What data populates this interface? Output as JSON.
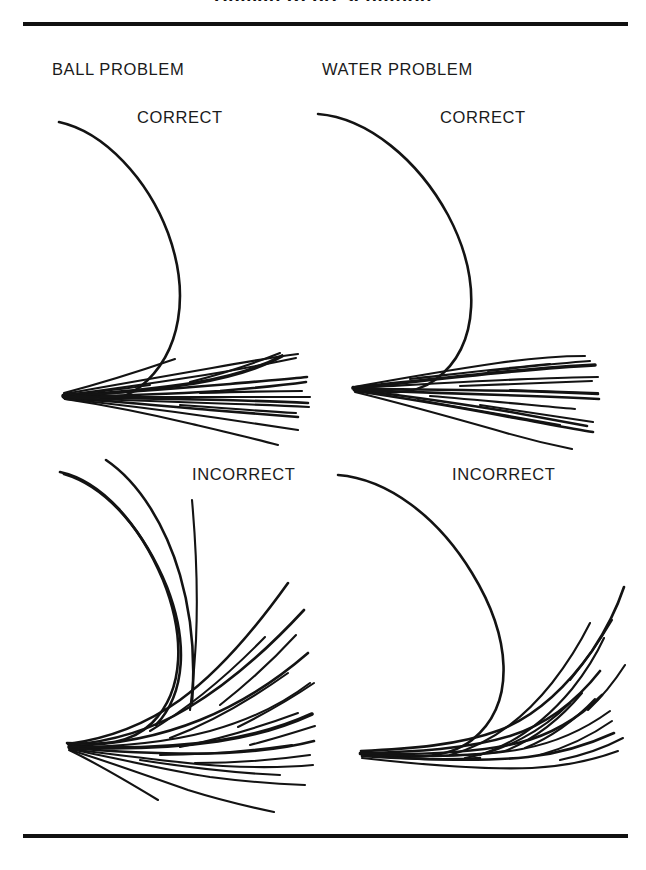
{
  "figure": {
    "clipped_title": "Human Representation",
    "top_rule": true,
    "bottom_rule": true
  },
  "columns": [
    {
      "id": "ball",
      "label": "BALL PROBLEM"
    },
    {
      "id": "water",
      "label": "WATER PROBLEM"
    }
  ],
  "panels": [
    {
      "id": "ball-correct",
      "column": "ball",
      "verdict": "CORRECT",
      "description": "Curved spiral-tube wall with a fan of straight trajectories leaving the tube mouth"
    },
    {
      "id": "water-correct",
      "column": "water",
      "verdict": "CORRECT",
      "description": "Curved tube wall with a fan of straight water streams leaving the tube mouth"
    },
    {
      "id": "ball-incorrect",
      "column": "ball",
      "verdict": "INCORRECT",
      "description": "Curved tube wall with curving trajectories that continue to bend after leaving the tube"
    },
    {
      "id": "water-incorrect",
      "column": "water",
      "verdict": "INCORRECT",
      "description": "Curved tube wall with curving water streams that continue to bend after leaving the tube"
    }
  ],
  "labels": {
    "correct": "CORRECT",
    "incorrect": "INCORRECT"
  },
  "colors": {
    "ink": "#131313",
    "paper": "#ffffff"
  }
}
